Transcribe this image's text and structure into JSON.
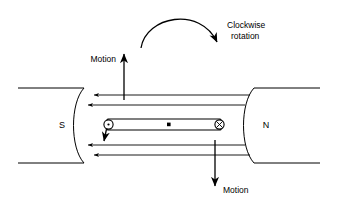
{
  "figure": {
    "background_color": "#ffffff",
    "line_color": "#000000",
    "labels": {
      "rotation_line1": "Clockwise",
      "rotation_line2": "rotation",
      "motion_top": "Motion",
      "motion_bottom": "Motion",
      "pole_left": "S",
      "pole_right": "N"
    },
    "annotations": {
      "rotation_arc_direction": "clockwise",
      "top_conductor_motion": "up",
      "bottom_conductor_motion": "down",
      "field_direction": "right-to-left (N to S)",
      "field_line_count": 4,
      "left_conductor_current": "out-of-page",
      "right_conductor_current": "into-page",
      "center_marker": "dot"
    },
    "icons": {
      "current_out_of_page": "circle-dot-icon",
      "current_into_page": "circle-cross-icon",
      "rotation_arc": "clockwise-arc-arrow-icon",
      "motion_arrow_up": "arrow-up-icon",
      "motion_arrow_down": "arrow-down-icon",
      "field_arrow": "arrow-left-icon"
    },
    "geometry": {
      "left_pole_x": 18,
      "right_pole_x": 320,
      "gap_top_y": 88,
      "gap_bottom_y": 163,
      "coil_left_x": 104,
      "coil_right_x": 224,
      "coil_y": 125
    }
  }
}
